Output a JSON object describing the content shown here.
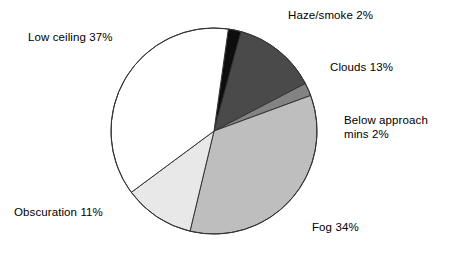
{
  "chart_data": {
    "type": "pie",
    "title": "",
    "subtitle": "",
    "xlabel": "",
    "ylabel": "",
    "grid": false,
    "legend_position": "none",
    "labels_outside": true,
    "units": "%",
    "start_angle_deg": -82,
    "direction": "clockwise",
    "categories": [
      "Haze/smoke",
      "Clouds",
      "Below approach mins",
      "Fog",
      "Obscuration",
      "Low ceiling"
    ],
    "values": [
      2,
      13,
      2,
      34,
      11,
      37
    ],
    "colors": [
      "#0d0d0d",
      "#4a4a4a",
      "#838383",
      "#bebebe",
      "#e8e8e8",
      "#ffffff"
    ],
    "slice_border_color": "#333333",
    "slices": [
      {
        "name": "Haze/smoke",
        "value": 2,
        "label": "Haze/smoke 2%",
        "color": "#0d0d0d"
      },
      {
        "name": "Clouds",
        "value": 13,
        "label": "Clouds 13%",
        "color": "#4a4a4a"
      },
      {
        "name": "Below approach mins",
        "value": 2,
        "label": "Below approach mins 2%",
        "color": "#838383"
      },
      {
        "name": "Fog",
        "value": 34,
        "label": "Fog 34%",
        "color": "#bebebe"
      },
      {
        "name": "Obscuration",
        "value": 11,
        "label": "Obscuration 11%",
        "color": "#e8e8e8"
      },
      {
        "name": "Low ceiling",
        "value": 37,
        "label": "Low ceiling 37%",
        "color": "#ffffff"
      }
    ]
  },
  "labels": {
    "haze": "Haze/smoke 2%",
    "clouds": "Clouds 13%",
    "below_line1": "Below approach",
    "below_line2": "mins 2%",
    "fog": "Fog 34%",
    "obscuration": "Obscuration 11%",
    "low_ceiling": "Low ceiling 37%"
  }
}
